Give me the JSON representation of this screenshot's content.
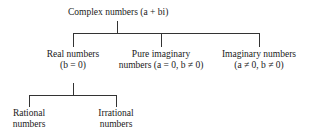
{
  "diagram": {
    "root": {
      "label": "Complex numbers (a + bi)"
    },
    "children": [
      {
        "line1": "Real numbers",
        "line2": "(b = 0)"
      },
      {
        "line1": "Pure imaginary",
        "line2": "numbers (a = 0, b ≠ 0)"
      },
      {
        "line1": "Imaginary numbers",
        "line2": "(a ≠ 0, b ≠ 0)"
      }
    ],
    "grandchildren": [
      {
        "line1": "Rational",
        "line2": "numbers"
      },
      {
        "line1": "Irrational",
        "line2": "numbers"
      }
    ]
  }
}
